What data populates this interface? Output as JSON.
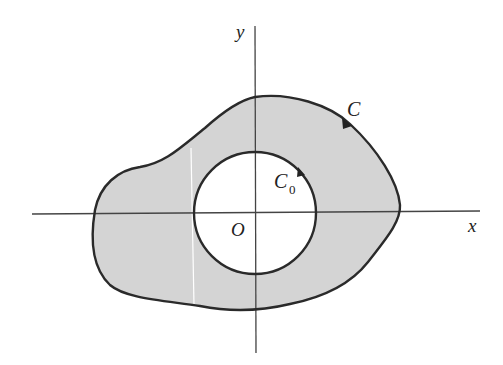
{
  "figure": {
    "labels": {
      "x_axis": "x",
      "y_axis": "y",
      "origin": "O",
      "outer_curve": "C",
      "inner_curve": "C",
      "inner_curve_subscript": "0"
    },
    "colors": {
      "region_fill": "#d4d4d4",
      "curve_stroke": "#2a2a2a",
      "axis_stroke": "#444444",
      "background": "#ffffff"
    }
  }
}
